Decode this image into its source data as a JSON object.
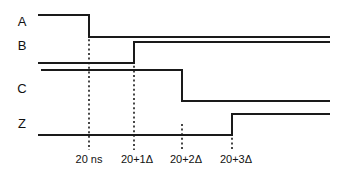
{
  "figure": {
    "type": "timing-diagram",
    "background_color": "#ffffff",
    "line_color": "#1a1a1a",
    "width": 347,
    "height": 175
  },
  "signals": [
    {
      "name": "A",
      "label": "A",
      "label_x": 22,
      "label_y": 23,
      "high_y": 15,
      "low_y": 37,
      "start_x": 38,
      "end_x": 330,
      "initial_level": "high",
      "transitions": [
        {
          "x": 89,
          "edge": "falling",
          "at_label": "20 ns"
        }
      ],
      "path": "M 38 15 L 89 15 L 89 37 L 330 37"
    },
    {
      "name": "B",
      "label": "B",
      "label_x": 22,
      "label_y": 47,
      "high_y": 42,
      "low_y": 63,
      "start_x": 38,
      "end_x": 330,
      "initial_level": "low",
      "transitions": [
        {
          "x": 134,
          "edge": "rising",
          "at_label": "20+1Δ"
        }
      ],
      "path": "M 38 63 L 134 63 L 134 42 L 330 42"
    },
    {
      "name": "C",
      "label": "C",
      "label_x": 22,
      "label_y": 90,
      "high_y": 70,
      "low_y": 101,
      "start_x": 41,
      "end_x": 330,
      "initial_level": "high",
      "transitions": [
        {
          "x": 182,
          "edge": "falling",
          "at_label": "20+2Δ"
        }
      ],
      "path": "M 41 70 L 182 70 L 182 101 L 330 101"
    },
    {
      "name": "Z",
      "label": "Z",
      "label_x": 22,
      "label_y": 125,
      "high_y": 114,
      "low_y": 135,
      "start_x": 38,
      "end_x": 330,
      "initial_level": "low",
      "transitions": [
        {
          "x": 232,
          "edge": "rising",
          "at_label": "20+3Δ"
        }
      ],
      "path": "M 38 135 L 232 135 L 232 114 L 330 114"
    }
  ],
  "time_markers": [
    {
      "label": "20 ns",
      "x": 89,
      "label_x": 89,
      "label_y": 160,
      "line_top": 30,
      "line_bottom": 150
    },
    {
      "label": "20+1Δ",
      "x": 134,
      "label_x": 137,
      "label_y": 160,
      "line_top": 52,
      "line_bottom": 150
    },
    {
      "label": "20+2Δ",
      "x": 182,
      "label_x": 186,
      "label_y": 160,
      "line_top": 124,
      "line_bottom": 150
    },
    {
      "label": "20+3Δ",
      "x": 232,
      "label_x": 236,
      "label_y": 160,
      "line_top": 124,
      "line_bottom": 150
    }
  ],
  "chart_data": {
    "type": "line",
    "title": "",
    "xlabel": "",
    "ylabel": "",
    "x_tick_labels": [
      "20 ns",
      "20+1Δ",
      "20+2Δ",
      "20+3Δ"
    ],
    "x_tick_positions": [
      89,
      134,
      182,
      232
    ],
    "legend": [],
    "grid": false,
    "series": [
      {
        "name": "A",
        "values": [
          "high",
          "low"
        ],
        "transition_times": [
          "20 ns"
        ]
      },
      {
        "name": "B",
        "values": [
          "low",
          "high"
        ],
        "transition_times": [
          "20+1Δ"
        ]
      },
      {
        "name": "C",
        "values": [
          "high",
          "low"
        ],
        "transition_times": [
          "20+2Δ"
        ]
      },
      {
        "name": "Z",
        "values": [
          "low",
          "high"
        ],
        "transition_times": [
          "20+3Δ"
        ]
      }
    ]
  }
}
